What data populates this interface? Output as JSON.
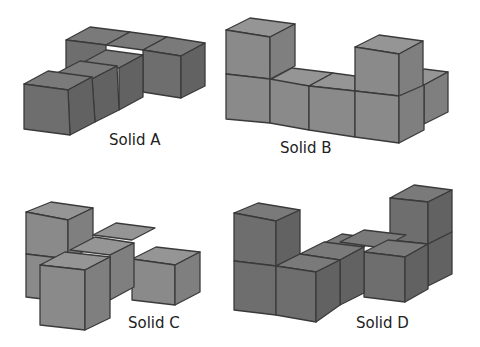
{
  "solids": [
    {
      "id": "A",
      "label": "Solid A",
      "cubes": 6,
      "shape": "T-shaped single layer"
    },
    {
      "id": "B",
      "label": "Solid B",
      "cubes": 7,
      "shape": "row of 4 with back cube, two raised cubes"
    },
    {
      "id": "C",
      "label": "Solid C",
      "cubes": 6,
      "shape": "T-shaped with one raised cube at back-left"
    },
    {
      "id": "D",
      "label": "Solid D",
      "cubes": 8,
      "shape": "U/zigzag with two raised towers"
    }
  ],
  "colors": {
    "cube_dark": "#6e6e6e",
    "cube_light": "#8a8a8a",
    "edge": "#3a3a3a",
    "background": "#ffffff"
  }
}
